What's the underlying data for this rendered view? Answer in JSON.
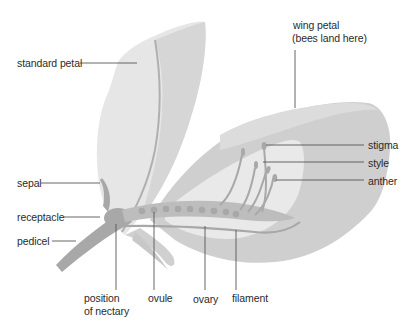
{
  "diagram": {
    "colors": {
      "background": "#ffffff",
      "petal_light": "#e6e6e6",
      "petal_mid": "#d2d2d2",
      "petal_dark": "#c4c4c4",
      "inner_cavity": "#ebebeb",
      "structure": "#a8a8a8",
      "leader_line": "#555555",
      "text": "#2b2b2b"
    },
    "labels": {
      "standard_petal": "standard petal",
      "wing_petal_line1": "wing petal",
      "wing_petal_line2": "(bees land here)",
      "stigma": "stigma",
      "style": "style",
      "anther": "anther",
      "sepal": "sepal",
      "receptacle": "receptacle",
      "pedicel": "pedicel",
      "nectary_line1": "position",
      "nectary_line2": "of nectary",
      "ovule": "ovule",
      "ovary": "ovary",
      "filament": "filament"
    }
  }
}
